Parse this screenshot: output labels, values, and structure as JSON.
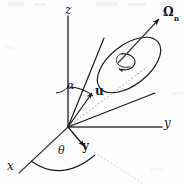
{
  "figure": {
    "background_color": "#fdfdfd",
    "stroke_color": "#1a1a1a",
    "dotted_color": "#b9b9b9",
    "labels": {
      "axis_z": "z",
      "axis_y": "y",
      "axis_x": "x",
      "alpha": "α",
      "theta": "θ",
      "unit_vector_u": "u",
      "unit_vector_y": "y",
      "omega": "Ω",
      "omega_subscript": "n"
    },
    "geometry": {
      "origin": {
        "x": 68,
        "y": 127
      },
      "axis_z_tip": {
        "x": 68,
        "y": 16
      },
      "axis_y_tip": {
        "x": 160,
        "y": 127
      },
      "axis_x_tip": {
        "x": 20,
        "y": 172
      },
      "cone_axis_tip": {
        "x": 148,
        "y": 73
      },
      "omega_arrow_start": {
        "x": 120,
        "y": 62
      },
      "omega_arrow_end": {
        "x": 160,
        "y": 18
      },
      "u_arrow_start": {
        "x": 68,
        "y": 127
      },
      "u_arrow_end": {
        "x": 93,
        "y": 92
      },
      "yvec_arrow_start": {
        "x": 68,
        "y": 127
      },
      "yvec_arrow_end": {
        "x": 84,
        "y": 147
      }
    },
    "annotations": {
      "alpha_description": "polar angle between z-axis and cone axis u",
      "theta_description": "azimuthal angle in the x-y plane measured from x-axis",
      "omega_description": "solid angle direction normal vector"
    }
  }
}
